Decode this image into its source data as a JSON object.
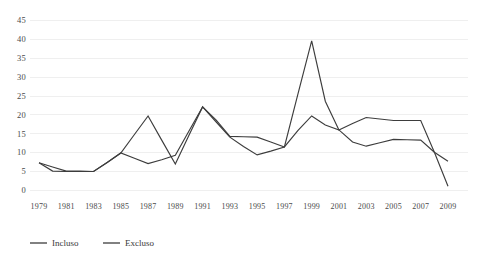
{
  "chart_data": {
    "type": "line",
    "title": "",
    "subtitle": "",
    "xlabel": "",
    "ylabel": "",
    "x": [
      1979,
      1980,
      1981,
      1982,
      1983,
      1984,
      1985,
      1986,
      1987,
      1988,
      1989,
      1990,
      1991,
      1992,
      1993,
      1994,
      1995,
      1996,
      1997,
      1998,
      1999,
      2000,
      2001,
      2002,
      2003,
      2004,
      2005,
      2006,
      2007,
      2008,
      2009
    ],
    "xlim": [
      1979,
      2009
    ],
    "ylim": [
      0,
      45
    ],
    "yticks": [
      0,
      5,
      10,
      15,
      20,
      25,
      30,
      35,
      40,
      45
    ],
    "xticks": [
      1979,
      1981,
      1983,
      1985,
      1987,
      1989,
      1991,
      1993,
      1995,
      1997,
      1999,
      2001,
      2003,
      2005,
      2007,
      2009
    ],
    "xtick_labels": [
      "1979",
      "1981",
      "1983",
      "1985",
      "1987",
      "1989",
      "1991",
      "1993",
      "1995",
      "1997",
      "1999",
      "2001",
      "2003",
      "2005",
      "2007",
      "2009"
    ],
    "ytick_labels": [
      "0",
      "5",
      "10",
      "15",
      "20",
      "25",
      "30",
      "35",
      "40",
      "45"
    ],
    "grid": "horizontal",
    "grid_color": "#efefef",
    "legend_position": "bottom-left",
    "series": [
      {
        "name": "Incluso",
        "color": "#3d3d3d",
        "values": [
          7.2,
          5.0,
          4.9,
          4.9,
          4.9,
          7.3,
          9.8,
          14.7,
          19.6,
          13.2,
          6.9,
          14.5,
          22.0,
          18.0,
          14.0,
          11.5,
          9.3,
          10.3,
          11.4,
          15.8,
          19.6,
          17.2,
          15.9,
          12.7,
          11.6,
          12.5,
          13.4,
          13.3,
          13.2,
          10.0,
          7.6
        ]
      },
      {
        "name": "Excluso",
        "color": "#3d3d3d",
        "values": [
          7.2,
          6.1,
          5.0,
          5.0,
          4.9,
          7.3,
          9.8,
          8.4,
          7.0,
          8.0,
          9.2,
          15.6,
          22.0,
          18.5,
          14.2,
          14.1,
          14.0,
          12.7,
          11.4,
          25.5,
          39.5,
          23.5,
          15.9,
          17.6,
          19.2,
          18.8,
          18.4,
          18.4,
          18.4,
          10.0,
          1.0
        ]
      }
    ]
  },
  "legend": {
    "items": [
      {
        "label": "Incluso"
      },
      {
        "label": "Excluso"
      }
    ]
  }
}
